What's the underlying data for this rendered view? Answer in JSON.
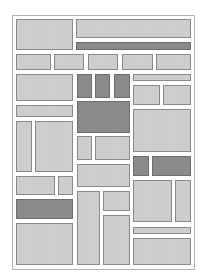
{
  "diagram": {
    "type": "block-layout",
    "frame": {
      "x": 12,
      "y": 15,
      "w": 183,
      "h": 255,
      "border": "#b4b4b4"
    },
    "colors": {
      "light_fill": "#cfcfcf",
      "dark_fill": "#8b8b8b",
      "border": "#8a8a8a",
      "background": "#ffffff"
    },
    "blocks": [
      {
        "id": "b1",
        "x": 16,
        "y": 19,
        "w": 57,
        "h": 31,
        "tone": "light"
      },
      {
        "id": "b2",
        "x": 76,
        "y": 19,
        "w": 115,
        "h": 19,
        "tone": "light"
      },
      {
        "id": "b3",
        "x": 76,
        "y": 42,
        "w": 115,
        "h": 8,
        "tone": "dark"
      },
      {
        "id": "b4",
        "x": 16,
        "y": 54,
        "w": 35,
        "h": 16,
        "tone": "light"
      },
      {
        "id": "b5",
        "x": 54,
        "y": 54,
        "w": 30,
        "h": 16,
        "tone": "light"
      },
      {
        "id": "b6",
        "x": 88,
        "y": 54,
        "w": 30,
        "h": 16,
        "tone": "light"
      },
      {
        "id": "b7",
        "x": 122,
        "y": 54,
        "w": 31,
        "h": 16,
        "tone": "light"
      },
      {
        "id": "b8",
        "x": 156,
        "y": 54,
        "w": 35,
        "h": 16,
        "tone": "light"
      },
      {
        "id": "b9",
        "x": 16,
        "y": 74,
        "w": 57,
        "h": 27,
        "tone": "light"
      },
      {
        "id": "b10",
        "x": 77,
        "y": 74,
        "w": 15,
        "h": 24,
        "tone": "dark"
      },
      {
        "id": "b11",
        "x": 95,
        "y": 74,
        "w": 15,
        "h": 24,
        "tone": "dark"
      },
      {
        "id": "b12",
        "x": 114,
        "y": 74,
        "w": 16,
        "h": 24,
        "tone": "dark"
      },
      {
        "id": "b13",
        "x": 133,
        "y": 74,
        "w": 58,
        "h": 7,
        "tone": "light"
      },
      {
        "id": "b14",
        "x": 133,
        "y": 85,
        "w": 27,
        "h": 20,
        "tone": "light"
      },
      {
        "id": "b15",
        "x": 163,
        "y": 85,
        "w": 28,
        "h": 20,
        "tone": "light"
      },
      {
        "id": "b16",
        "x": 16,
        "y": 105,
        "w": 57,
        "h": 12,
        "tone": "light"
      },
      {
        "id": "b17",
        "x": 77,
        "y": 101,
        "w": 53,
        "h": 32,
        "tone": "dark"
      },
      {
        "id": "b18",
        "x": 133,
        "y": 109,
        "w": 58,
        "h": 43,
        "tone": "light"
      },
      {
        "id": "b19",
        "x": 16,
        "y": 121,
        "w": 16,
        "h": 51,
        "tone": "light"
      },
      {
        "id": "b20",
        "x": 35,
        "y": 121,
        "w": 38,
        "h": 51,
        "tone": "light"
      },
      {
        "id": "b21",
        "x": 77,
        "y": 136,
        "w": 15,
        "h": 24,
        "tone": "light"
      },
      {
        "id": "b22",
        "x": 95,
        "y": 136,
        "w": 35,
        "h": 24,
        "tone": "light"
      },
      {
        "id": "b23",
        "x": 77,
        "y": 164,
        "w": 53,
        "h": 23,
        "tone": "light"
      },
      {
        "id": "b24",
        "x": 133,
        "y": 156,
        "w": 16,
        "h": 20,
        "tone": "dark"
      },
      {
        "id": "b25",
        "x": 152,
        "y": 156,
        "w": 39,
        "h": 20,
        "tone": "dark"
      },
      {
        "id": "b26",
        "x": 16,
        "y": 176,
        "w": 39,
        "h": 19,
        "tone": "light"
      },
      {
        "id": "b27",
        "x": 58,
        "y": 176,
        "w": 15,
        "h": 19,
        "tone": "light"
      },
      {
        "id": "b28",
        "x": 16,
        "y": 199,
        "w": 57,
        "h": 20,
        "tone": "dark"
      },
      {
        "id": "b29",
        "x": 16,
        "y": 223,
        "w": 57,
        "h": 42,
        "tone": "light"
      },
      {
        "id": "b30",
        "x": 77,
        "y": 191,
        "w": 23,
        "h": 74,
        "tone": "light"
      },
      {
        "id": "b31",
        "x": 103,
        "y": 191,
        "w": 27,
        "h": 20,
        "tone": "light"
      },
      {
        "id": "b32",
        "x": 103,
        "y": 215,
        "w": 27,
        "h": 50,
        "tone": "light"
      },
      {
        "id": "b33",
        "x": 133,
        "y": 180,
        "w": 39,
        "h": 42,
        "tone": "light"
      },
      {
        "id": "b34",
        "x": 175,
        "y": 180,
        "w": 16,
        "h": 42,
        "tone": "light"
      },
      {
        "id": "b35",
        "x": 133,
        "y": 227,
        "w": 58,
        "h": 7,
        "tone": "light"
      },
      {
        "id": "b36",
        "x": 133,
        "y": 238,
        "w": 58,
        "h": 27,
        "tone": "light"
      }
    ]
  }
}
